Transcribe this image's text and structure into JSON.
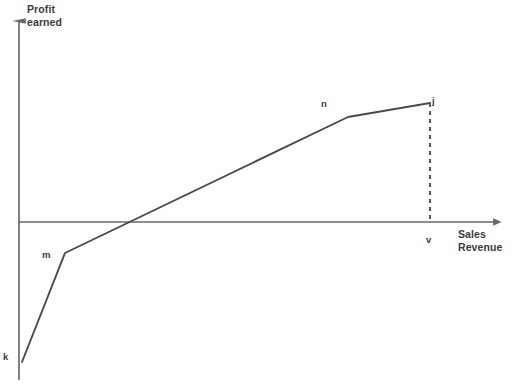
{
  "chart_data": {
    "type": "line",
    "title": "",
    "subtitle": "",
    "xlabel": "Sales Revenue",
    "ylabel": "Profit earned",
    "ylabel_line1": "Profit",
    "ylabel_line2": "earned",
    "xlabel_line1": "Sales",
    "xlabel_line2": "Revenue",
    "grid": false,
    "legend": "none",
    "axis_style": "arrow-headed x and y axes crossing at origin, no tick values",
    "xlim": [
      0,
      100
    ],
    "ylim": [
      -45,
      40
    ],
    "line_color": "#4a4a4a",
    "axis_color": "#6a6a6a",
    "series": [
      {
        "name": "Profit curve",
        "points": [
          {
            "label": "k",
            "x": 0.7,
            "y": -42.0,
            "note": "start of curve, fixed-cost loss at zero sales"
          },
          {
            "label": "m",
            "x": 9.6,
            "y": -10.8,
            "note": "first kink, slope becomes shallower"
          },
          {
            "label": "",
            "x": 23.2,
            "y": 0,
            "note": "break-even point, curve crosses x-axis"
          },
          {
            "label": "n",
            "x": 68.8,
            "y": 36.5,
            "note": "second kink, slope flattens"
          },
          {
            "label": "j",
            "x": 86.0,
            "y": 41.4,
            "note": "end of curve, profit at output v"
          }
        ]
      }
    ],
    "annotations": [
      {
        "name": "dashed-drop-line",
        "type": "dashed-vertical",
        "x": 86.0,
        "from_y": 41.4,
        "to_y": 0,
        "label": "v"
      },
      {
        "name": "x-axis-marker",
        "label": "v",
        "x": 86.0,
        "y": 0
      }
    ],
    "point_labels": {
      "k": "k",
      "m": "m",
      "n": "n",
      "j": "j",
      "v": "v"
    }
  },
  "geometry": {
    "y_axis": {
      "x": 19,
      "y_top": 20,
      "y_bottom": 380,
      "arrow": "up"
    },
    "x_axis": {
      "y": 222,
      "x_left": 19,
      "x_right": 497,
      "arrow": "right"
    },
    "polyline": "22,362 65,253 348,117 430,103",
    "dashed_line": {
      "x": 430,
      "y_top": 103,
      "y_bottom": 222
    }
  }
}
